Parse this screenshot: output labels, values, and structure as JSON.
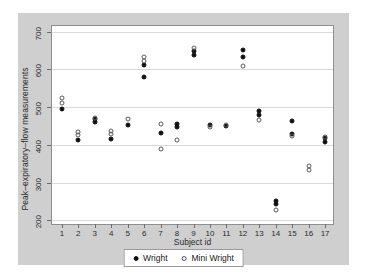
{
  "chart_data": {
    "type": "scatter",
    "title": "",
    "xlabel": "Subject id",
    "ylabel": "Peak–expiratory–flow measurements",
    "xlim": [
      0.4,
      17.6
    ],
    "ylim": [
      185,
      715
    ],
    "xticks": [
      1,
      2,
      3,
      4,
      5,
      6,
      7,
      8,
      9,
      10,
      11,
      12,
      13,
      14,
      15,
      16,
      17
    ],
    "yticks": [
      200,
      300,
      400,
      500,
      600,
      700
    ],
    "grid": true,
    "legend_position": "bottom-center",
    "series": [
      {
        "name": "Wright",
        "marker": "filled-circle",
        "color": "#111111",
        "points": [
          {
            "x": 1,
            "y": 494
          },
          {
            "x": 2,
            "y": 412
          },
          {
            "x": 3,
            "y": 460
          },
          {
            "x": 3,
            "y": 468
          },
          {
            "x": 4,
            "y": 416
          },
          {
            "x": 5,
            "y": 452
          },
          {
            "x": 6,
            "y": 580
          },
          {
            "x": 6,
            "y": 612
          },
          {
            "x": 7,
            "y": 432
          },
          {
            "x": 8,
            "y": 456
          },
          {
            "x": 8,
            "y": 448
          },
          {
            "x": 9,
            "y": 650
          },
          {
            "x": 9,
            "y": 638
          },
          {
            "x": 10,
            "y": 452
          },
          {
            "x": 11,
            "y": 450
          },
          {
            "x": 12,
            "y": 652
          },
          {
            "x": 12,
            "y": 634
          },
          {
            "x": 13,
            "y": 490
          },
          {
            "x": 13,
            "y": 478
          },
          {
            "x": 14,
            "y": 252
          },
          {
            "x": 14,
            "y": 244
          },
          {
            "x": 15,
            "y": 462
          },
          {
            "x": 15,
            "y": 430
          },
          {
            "x": 17,
            "y": 418
          },
          {
            "x": 17,
            "y": 408
          }
        ]
      },
      {
        "name": "Mini Wright",
        "marker": "hollow-circle",
        "color": "#5a5a5a",
        "points": [
          {
            "x": 1,
            "y": 512
          },
          {
            "x": 1,
            "y": 525
          },
          {
            "x": 2,
            "y": 425
          },
          {
            "x": 2,
            "y": 434
          },
          {
            "x": 3,
            "y": 472
          },
          {
            "x": 4,
            "y": 430
          },
          {
            "x": 4,
            "y": 438
          },
          {
            "x": 5,
            "y": 468
          },
          {
            "x": 6,
            "y": 622
          },
          {
            "x": 6,
            "y": 632
          },
          {
            "x": 7,
            "y": 456
          },
          {
            "x": 7,
            "y": 390
          },
          {
            "x": 8,
            "y": 412
          },
          {
            "x": 9,
            "y": 656
          },
          {
            "x": 10,
            "y": 448
          },
          {
            "x": 11,
            "y": 452
          },
          {
            "x": 12,
            "y": 608
          },
          {
            "x": 13,
            "y": 466
          },
          {
            "x": 14,
            "y": 228
          },
          {
            "x": 15,
            "y": 424
          },
          {
            "x": 16,
            "y": 344
          },
          {
            "x": 16,
            "y": 334
          },
          {
            "x": 17,
            "y": 422
          }
        ]
      }
    ]
  },
  "legend": {
    "entries": [
      {
        "label": "Wright",
        "marker": "filled"
      },
      {
        "label": "Mini Wright",
        "marker": "hollow"
      }
    ]
  }
}
